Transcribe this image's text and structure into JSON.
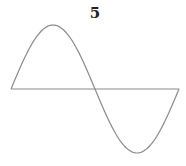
{
  "figure": {
    "label": "5",
    "colors": {
      "curve": "#8a8a8a",
      "axis": "#8a8a8a",
      "label": "#222222",
      "background": "#ffffff"
    },
    "geometry": {
      "axis_y": 89,
      "x_start": 11,
      "x_end": 179,
      "amplitude_px": 64,
      "periods": 1
    }
  }
}
